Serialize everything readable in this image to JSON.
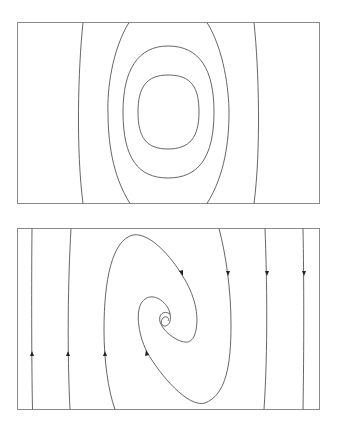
{
  "figure": {
    "panels": [
      {
        "name": "center",
        "kind": "closed orbits (center)",
        "orbits": 5,
        "arrows": false
      },
      {
        "name": "spiral",
        "kind": "spiral sink with vertical trajectories",
        "arrows": true,
        "left_trajectories_direction": "up",
        "right_trajectories_direction": "down"
      }
    ],
    "colors": {
      "frame": "#8a8a8a",
      "curve": "#555555",
      "arrow": "#222222",
      "background": "#ffffff"
    }
  }
}
